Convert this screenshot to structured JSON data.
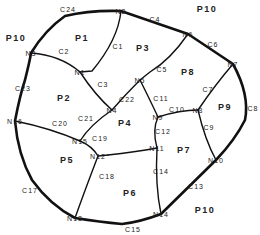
{
  "regions": [
    {
      "id": "P1",
      "x": 82,
      "y": 38
    },
    {
      "id": "P2",
      "x": 64,
      "y": 98
    },
    {
      "id": "P3",
      "x": 143,
      "y": 48
    },
    {
      "id": "P4",
      "x": 125,
      "y": 123
    },
    {
      "id": "P5",
      "x": 67,
      "y": 160
    },
    {
      "id": "P6",
      "x": 130,
      "y": 193
    },
    {
      "id": "P7",
      "x": 184,
      "y": 150
    },
    {
      "id": "P8",
      "x": 188,
      "y": 72
    },
    {
      "id": "P9",
      "x": 225,
      "y": 107
    },
    {
      "id": "P10a",
      "label": "P10",
      "x": 16,
      "y": 38
    },
    {
      "id": "P10b",
      "label": "P10",
      "x": 207,
      "y": 9
    },
    {
      "id": "P10c",
      "label": "P10",
      "x": 205,
      "y": 210
    }
  ],
  "nodes": [
    {
      "id": "N1",
      "x": 80,
      "y": 72
    },
    {
      "id": "N2",
      "x": 121,
      "y": 11
    },
    {
      "id": "N3",
      "x": 31,
      "y": 53
    },
    {
      "id": "N4",
      "x": 112,
      "y": 110
    },
    {
      "id": "N5",
      "x": 140,
      "y": 80
    },
    {
      "id": "N6",
      "x": 188,
      "y": 34
    },
    {
      "id": "N7",
      "x": 233,
      "y": 64
    },
    {
      "id": "N8",
      "x": 198,
      "y": 110
    },
    {
      "id": "N9",
      "x": 158,
      "y": 117
    },
    {
      "id": "N10",
      "x": 216,
      "y": 160
    },
    {
      "id": "N11",
      "x": 157,
      "y": 148
    },
    {
      "id": "N12",
      "x": 98,
      "y": 156
    },
    {
      "id": "N13",
      "x": 75,
      "y": 218
    },
    {
      "id": "N14",
      "x": 161,
      "y": 214
    },
    {
      "id": "N15",
      "x": 80,
      "y": 141
    },
    {
      "id": "N16",
      "x": 15,
      "y": 121
    }
  ],
  "connections": [
    {
      "id": "C1",
      "x": 118,
      "y": 46
    },
    {
      "id": "C2",
      "x": 64,
      "y": 51
    },
    {
      "id": "C3",
      "x": 103,
      "y": 84
    },
    {
      "id": "C4",
      "x": 155,
      "y": 19
    },
    {
      "id": "C5",
      "x": 162,
      "y": 69
    },
    {
      "id": "C6",
      "x": 213,
      "y": 44
    },
    {
      "id": "C7",
      "x": 208,
      "y": 89
    },
    {
      "id": "C8",
      "x": 253,
      "y": 108
    },
    {
      "id": "C9",
      "x": 209,
      "y": 127
    },
    {
      "id": "C10",
      "x": 177,
      "y": 109
    },
    {
      "id": "C11",
      "x": 161,
      "y": 98
    },
    {
      "id": "C12",
      "x": 163,
      "y": 131
    },
    {
      "id": "C13",
      "x": 196,
      "y": 186
    },
    {
      "id": "C14",
      "x": 161,
      "y": 171
    },
    {
      "id": "C15",
      "x": 133,
      "y": 229
    },
    {
      "id": "C17",
      "x": 30,
      "y": 190
    },
    {
      "id": "C18",
      "x": 107,
      "y": 176
    },
    {
      "id": "C19",
      "x": 100,
      "y": 138
    },
    {
      "id": "C20",
      "x": 60,
      "y": 123
    },
    {
      "id": "C21",
      "x": 86,
      "y": 118
    },
    {
      "id": "C22",
      "x": 127,
      "y": 99
    },
    {
      "id": "C23",
      "x": 23,
      "y": 88
    },
    {
      "id": "C24",
      "x": 68,
      "y": 9
    }
  ],
  "style": {
    "line_color": "#111111",
    "label_color": "#222222",
    "background": "#ffffff"
  }
}
